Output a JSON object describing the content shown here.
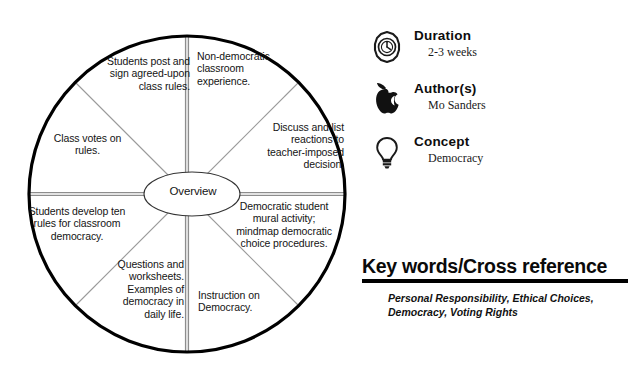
{
  "diagram": {
    "hub_label": "Overview",
    "segments": [
      {
        "id": "students-post-sign",
        "text": "Students post and sign agreed-upon class rules."
      },
      {
        "id": "non-democratic-experience",
        "text": "Non-democratic classroom experience."
      },
      {
        "id": "discuss-list-reactions",
        "text": "Discuss and list reactions to teacher-imposed decision."
      },
      {
        "id": "democratic-mural-mindmap",
        "text": "Democratic student mural activity; mindmap democratic choice procedures."
      },
      {
        "id": "instruction-on-democracy",
        "text": "Instruction on Democracy."
      },
      {
        "id": "questions-worksheets",
        "text": "Questions and worksheets. Examples of democracy in daily life."
      },
      {
        "id": "students-develop-rules",
        "text": "Students develop ten rules for classroom democracy."
      },
      {
        "id": "class-votes-on-rules",
        "text": "Class votes on rules."
      }
    ]
  },
  "meta": {
    "rows": [
      {
        "icon": "stopwatch-icon",
        "label": "Duration",
        "value": "2-3 weeks"
      },
      {
        "icon": "apple-icon",
        "label": "Author(s)",
        "value": "Mo Sanders"
      },
      {
        "icon": "lightbulb-icon",
        "label": "Concept",
        "value": "Democracy"
      }
    ]
  },
  "keywords": {
    "heading": "Key words/Cross reference",
    "text": "Personal Responsibility, Ethical Choices, Democracy, Voting Rights"
  },
  "colors": {
    "ink": "#000000",
    "spoke_gray": "#8d8d8d",
    "background": "#ffffff"
  }
}
